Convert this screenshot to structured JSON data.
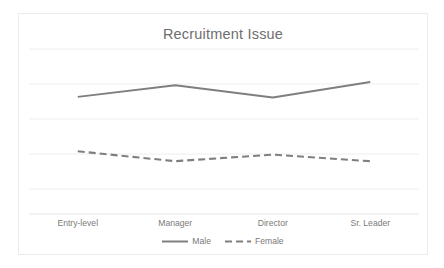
{
  "card": {
    "border_color": "#e9ebec",
    "background": "#ffffff"
  },
  "chart_data": {
    "type": "line",
    "title": "Recruitment Issue",
    "xlabel": "",
    "ylabel": "",
    "categories": [
      "Entry-level",
      "Manager",
      "Director",
      "Sr. Leader"
    ],
    "series": [
      {
        "name": "Male",
        "values": [
          3.55,
          3.9,
          3.53,
          4.0
        ],
        "style": "solid",
        "color": "#7f7f7f"
      },
      {
        "name": "Female",
        "values": [
          1.9,
          1.6,
          1.8,
          1.6
        ],
        "style": "dashed",
        "color": "#7f7f7f"
      }
    ],
    "ylim": [
      0,
      5
    ],
    "yticks": [
      0,
      1,
      2,
      3,
      4,
      5
    ],
    "ytick_labels_visible": false,
    "grid": true,
    "grid_color": "#eceff0",
    "legend": [
      "Male",
      "Female"
    ],
    "legend_position": "bottom"
  },
  "legend": {
    "male_label": "Male",
    "female_label": "Female"
  },
  "axis": {
    "tick_0": "Entry-level",
    "tick_1": "Manager",
    "tick_2": "Director",
    "tick_3": "Sr. Leader"
  }
}
